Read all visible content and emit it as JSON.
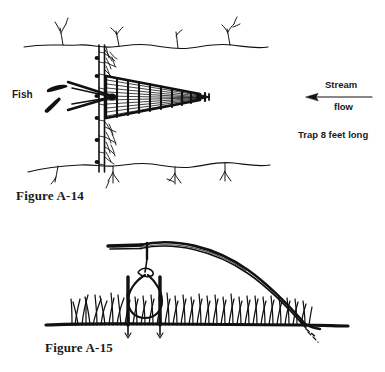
{
  "document": {
    "background_color": "#ffffff",
    "ink_color": "#111111"
  },
  "figures": [
    {
      "id": "figure-a14",
      "caption": "Figure A-14",
      "subject": "Stream fish trap with weir fence and conical basket",
      "annotations": {
        "fish": "Fish",
        "stream": "Stream",
        "flow": "flow",
        "trap_length": "Trap 8 feet long"
      },
      "arrow_direction": "left"
    },
    {
      "id": "figure-a15",
      "caption": "Figure A-15",
      "subject": "Bent sapling spring snare with hanging noose in grass"
    }
  ],
  "captions": {
    "a14": "Figure A-14",
    "a15": "Figure A-15"
  },
  "labels": {
    "fish": "Fish",
    "stream": "Stream",
    "flow": "flow",
    "trap_length": "Trap 8 feet long"
  }
}
